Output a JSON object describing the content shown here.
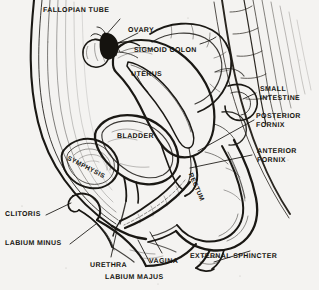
{
  "figure": {
    "background_color": "#f4f3f1",
    "ink_color": "#16140f",
    "width": 319,
    "height": 290
  },
  "labels": {
    "fallopian_tube": "FALLOPIAN TUBE",
    "ovary": "OVARY",
    "sigmoid_colon": "SIGMOID COLON",
    "uterus": "UTERUS",
    "small_intestine": "SMALL\nINTESTINE",
    "posterior_fornix": "POSTERIOR\nFORNIX",
    "anterior_fornix": "ANTERIOR\nFORNIX",
    "bladder": "BLADDER",
    "symphysis": "SYMPHYSIS",
    "rectum": "RECTUM",
    "clitoris": "CLITORIS",
    "labium_minus": "LABIUM MINUS",
    "urethra": "URETHRA",
    "labium_majus": "LABIUM MAJUS",
    "vagina": "VAGINA",
    "external_sphincter": "EXTERNAL SPHINCTER"
  }
}
